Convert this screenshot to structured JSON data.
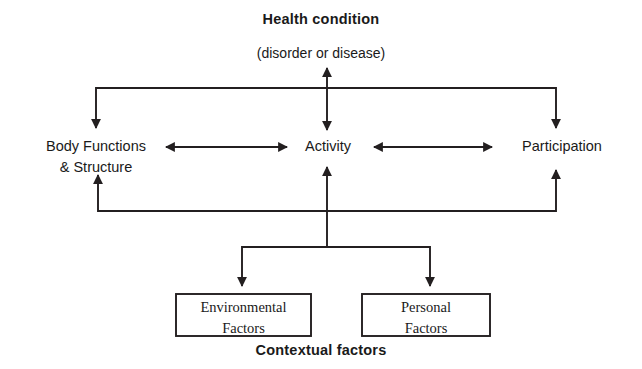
{
  "diagram": {
    "stroke_color": "#231f20",
    "text_color": "#1a1a1a",
    "background_color": "#ffffff",
    "nodes": {
      "health_condition": {
        "title": "Health condition",
        "subtitle": "(disorder or disease)"
      },
      "body_functions": {
        "label": "Body Functions\n& Structure"
      },
      "activity": {
        "label": "Activity"
      },
      "participation": {
        "label": "Participation"
      },
      "environmental_factors": {
        "label": "Environmental\nFactors"
      },
      "personal_factors": {
        "label": "Personal\nFactors"
      },
      "contextual_factors": {
        "label": "Contextual factors"
      }
    },
    "connectors": [
      {
        "name": "health-to-body-functions",
        "type": "elbow-arrow",
        "direction": "down"
      },
      {
        "name": "health-to-activity",
        "type": "double-arrow",
        "direction": "vertical"
      },
      {
        "name": "health-to-participation",
        "type": "elbow-arrow",
        "direction": "down"
      },
      {
        "name": "body-functions-to-activity",
        "type": "double-arrow",
        "direction": "horizontal"
      },
      {
        "name": "activity-to-participation",
        "type": "double-arrow",
        "direction": "horizontal"
      },
      {
        "name": "contextual-to-body-functions",
        "type": "elbow-arrow",
        "direction": "up"
      },
      {
        "name": "contextual-to-activity",
        "type": "arrow",
        "direction": "up"
      },
      {
        "name": "contextual-to-participation",
        "type": "elbow-arrow",
        "direction": "up"
      },
      {
        "name": "activity-to-environmental-factors",
        "type": "elbow-arrow",
        "direction": "down"
      },
      {
        "name": "activity-to-personal-factors",
        "type": "elbow-arrow",
        "direction": "down"
      }
    ]
  }
}
